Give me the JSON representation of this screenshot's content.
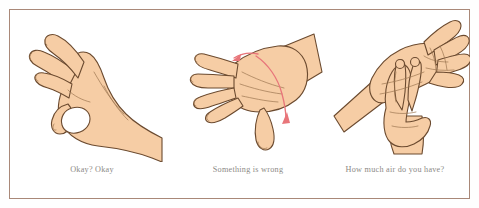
{
  "figure": {
    "background_color": "#ffffff",
    "frame_color": "#a98878",
    "skin_fill": "#f6cda5",
    "skin_shade": "#f0be90",
    "outline_color": "#6b4a2f",
    "arrow_color": "#e8757a",
    "caption_color": "#8d8a86"
  },
  "panels": [
    {
      "id": "okay",
      "caption": "Okay? Okay",
      "illustration_name": "hand-ok-sign",
      "description": "A single hand forming the OK circle with thumb and index finger",
      "arrows": []
    },
    {
      "id": "wrong",
      "caption": "Something is wrong",
      "illustration_name": "hand-flat-rocking",
      "description": "A flat hand seen from above with a rotation band and two arrows showing a side-to-side rocking motion",
      "arrows": [
        "arrow-up-left",
        "arrow-down"
      ]
    },
    {
      "id": "air",
      "caption": "How much air do you have?",
      "illustration_name": "two-hands-air-signal",
      "description": "One open palm with a second hand placing two fingers against it",
      "arrows": []
    }
  ]
}
